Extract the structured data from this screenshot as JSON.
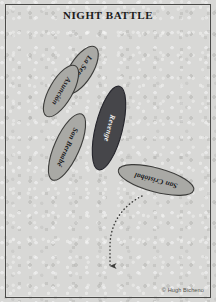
{
  "plate": {
    "title": "NIGHT BATTLE",
    "credit": "© Hugh Bicheno",
    "background_color": "#d8d8d6",
    "frame_color": "#4a4a48"
  },
  "ships": [
    {
      "name": "La Serena",
      "side": "spanish",
      "fill": "#a9a9a5",
      "stroke": "#3c3c3a",
      "label_color": "#17171a",
      "cx": 81,
      "cy": 70,
      "rx": 11.5,
      "ry": 27,
      "rotation": 32
    },
    {
      "name": "Asunción",
      "side": "spanish",
      "fill": "#a9a9a5",
      "stroke": "#3c3c3a",
      "label_color": "#17171a",
      "cx": 61,
      "cy": 91,
      "rx": 11.5,
      "ry": 29,
      "rotation": 30
    },
    {
      "name": "San Bernabé",
      "side": "spanish",
      "fill": "#a9a9a5",
      "stroke": "#3c3c3a",
      "label_color": "#17171a",
      "cx": 67,
      "cy": 147,
      "rx": 12.5,
      "ry": 36,
      "rotation": 24
    },
    {
      "name": "Revenge",
      "side": "english",
      "fill": "#46464a",
      "stroke": "#23232a",
      "label_color": "#f2f2f0",
      "cx": 109,
      "cy": 128,
      "rx": 13.5,
      "ry": 43,
      "rotation": 14
    },
    {
      "name": "San Cristóbal",
      "side": "spanish",
      "fill": "#a9a9a5",
      "stroke": "#3c3c3a",
      "label_color": "#17171a",
      "cx": 156,
      "cy": 180,
      "rx": 12,
      "ry": 39,
      "rotation": 105
    }
  ],
  "track": {
    "name": "escape-course",
    "style": "dotted",
    "color": "#3d3d3b",
    "path": "M 142 196 C 122 206, 110 224, 110 246 L 110 266",
    "arrow_tip_x": 110,
    "arrow_tip_y": 276
  }
}
